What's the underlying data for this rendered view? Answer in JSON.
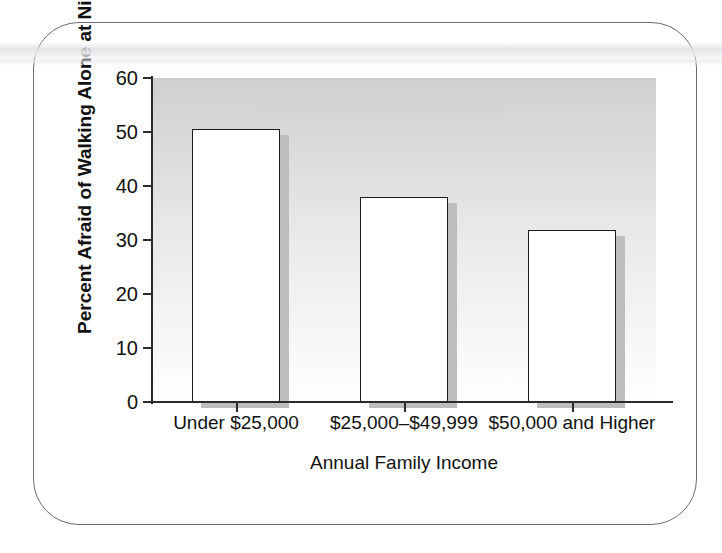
{
  "figure": {
    "frame_style": "rounded-rectangle-border",
    "border_color": "#6b6b6f",
    "background_color": "#ffffff"
  },
  "chart_data": {
    "type": "bar",
    "title": "",
    "subtitle": "",
    "xlabel": "Annual Family Income",
    "ylabel": "Percent Afraid of Walking Alone at Night",
    "categories": [
      "Under $25,000",
      "$25,000–$49,999",
      "$50,000 and Higher"
    ],
    "values": [
      50.5,
      38.0,
      31.8
    ],
    "ylim": [
      0,
      60
    ],
    "yticks": [
      0,
      10,
      20,
      30,
      40,
      50,
      60
    ],
    "ytick_labels": [
      "0",
      "10",
      "20",
      "30",
      "40",
      "50",
      "60"
    ],
    "grid": false,
    "legend": null,
    "legend_position": "none",
    "bar_fill_color": "#ffffff",
    "bar_edge_color": "#1d1d1d",
    "bar_shadow_color": "#bdbdbf",
    "plot_background": "vertical-gradient-gray-to-white",
    "plot_background_top_color": "#cfcfd1",
    "plot_background_bottom_color": "#ffffff",
    "axis_color": "#2b2b2b"
  }
}
